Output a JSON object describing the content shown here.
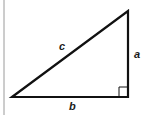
{
  "diagram": {
    "type": "right-triangle",
    "labels": {
      "hypotenuse": "c",
      "vertical_leg": "a",
      "horizontal_leg": "b"
    },
    "right_angle_marker": true,
    "colors": {
      "stroke": "#111111",
      "border": "#9a9a9a",
      "background": "#ffffff"
    }
  }
}
